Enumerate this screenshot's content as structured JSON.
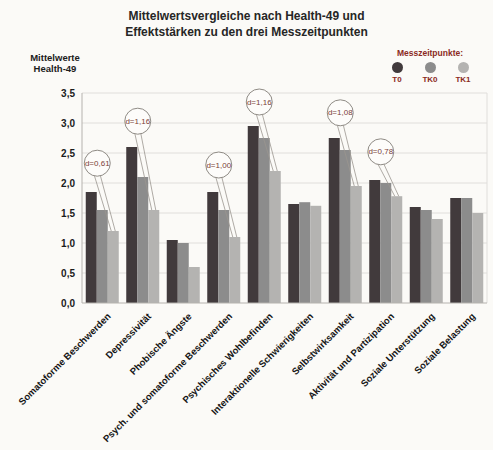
{
  "title": {
    "line1": "Mittelwertsvergleiche nach Health-49 und",
    "line2": "Effektstärken zu den drei Messzeitpunkten"
  },
  "y_axis": {
    "title_line1": "Mittelwerte",
    "title_line2": "Health-49"
  },
  "legend": {
    "title": "Messzeitpunkte:",
    "position": "top-right"
  },
  "chart_data": {
    "type": "bar",
    "title": "Mittelwertsvergleiche nach Health-49 und Effektstärken zu den drei Messzeitpunkten",
    "xlabel": "",
    "ylabel": "Mittelwerte Health-49",
    "ylim": [
      0,
      3.5
    ],
    "ytick_step": 0.5,
    "ytick_labels": [
      "0,0",
      "0,5",
      "1,0",
      "1,5",
      "2,0",
      "2,5",
      "3,0",
      "3,5"
    ],
    "grid": true,
    "legend_position": "top-right",
    "categories": [
      "Somatoforme Beschwerden",
      "Depressivität",
      "Phobische Ängste",
      "Psych. und somatoforme Beschwerden",
      "Psychisches Wohlbefinden",
      "Interaktionelle Schwierigkeiten",
      "Selbstwirksamkeit",
      "Aktivität und Partizipation",
      "Soziale Unterstützung",
      "Soziale Belastung"
    ],
    "series": [
      {
        "name": "T0",
        "color": "#413a3c",
        "values": [
          1.85,
          2.6,
          1.05,
          1.85,
          2.95,
          1.65,
          2.75,
          2.05,
          1.6,
          1.75
        ]
      },
      {
        "name": "TK0",
        "color": "#8c8c8c",
        "values": [
          1.55,
          2.1,
          1.0,
          1.55,
          2.75,
          1.68,
          2.55,
          2.0,
          1.55,
          1.75
        ]
      },
      {
        "name": "TK1",
        "color": "#b4b3b1",
        "values": [
          1.2,
          1.55,
          0.6,
          1.1,
          2.2,
          1.62,
          1.95,
          1.78,
          1.4,
          1.5
        ]
      }
    ],
    "annotations": [
      {
        "category_index": 0,
        "label": "d=0,61",
        "height": 2.33
      },
      {
        "category_index": 1,
        "label": "d=1,16",
        "height": 3.03
      },
      {
        "category_index": 3,
        "label": "d=1,00",
        "height": 2.3
      },
      {
        "category_index": 4,
        "label": "d=1,16",
        "height": 3.35
      },
      {
        "category_index": 6,
        "label": "d=1,08",
        "height": 3.17
      },
      {
        "category_index": 7,
        "label": "d=0,78",
        "height": 2.52
      }
    ]
  },
  "colors": {
    "t0": "#413a3c",
    "tk0": "#8c8c8c",
    "tk1": "#b4b3b1",
    "legend_text": "#8b2a23",
    "annotation_text": "#7a4038",
    "gridline": "#e0dedb",
    "axis": "#b5b2ae",
    "background": "#fbfaf7"
  }
}
